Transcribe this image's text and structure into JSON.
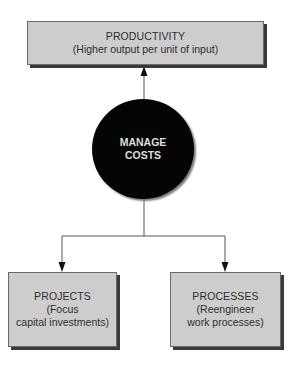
{
  "diagram": {
    "center": {
      "line1": "MANAGE",
      "line2": "COSTS"
    },
    "top": {
      "title": "PRODUCTIVITY",
      "subtitle": "(Higher output per unit of input)"
    },
    "left": {
      "title": "PROJECTS",
      "line2": "(Focus",
      "line3": "capital investments)"
    },
    "right": {
      "title": "PROCESSES",
      "line2": "(Reengineer",
      "line3": "work processes)"
    },
    "colors": {
      "box_fill": "#cdcdcd",
      "box_shadow": "#3a3a3a",
      "circle_fill": "#050505",
      "circle_text": "#dedede",
      "line": "#555555",
      "text": "#2e2e2e"
    }
  }
}
